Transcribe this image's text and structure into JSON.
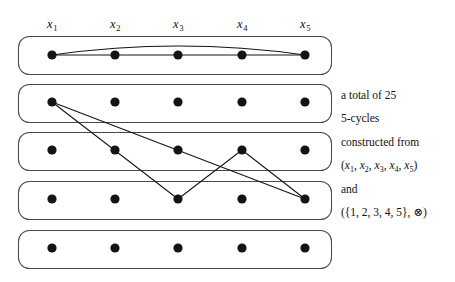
{
  "figure": {
    "columns": [
      {
        "id": "x1",
        "label": "x",
        "index": "1",
        "cx": 52
      },
      {
        "id": "x2",
        "label": "x",
        "index": "2",
        "cx": 115
      },
      {
        "id": "x3",
        "label": "x",
        "index": "3",
        "cx": 178
      },
      {
        "id": "x4",
        "label": "x",
        "index": "4",
        "cx": 242
      },
      {
        "id": "x5",
        "label": "x",
        "index": "5",
        "cx": 305
      }
    ],
    "column_header_y": 18,
    "rows": [
      {
        "id": "row-1",
        "cy": 55,
        "box_top": 36,
        "box_height": 38
      },
      {
        "id": "row-2",
        "cy": 102,
        "box_top": 84,
        "box_height": 38
      },
      {
        "id": "row-3",
        "cy": 150,
        "box_top": 132,
        "box_height": 38
      },
      {
        "id": "row-4",
        "cy": 199,
        "box_top": 181,
        "box_height": 38
      },
      {
        "id": "row-5",
        "cy": 248,
        "box_top": 230,
        "box_height": 38
      }
    ],
    "box_left": 18,
    "box_width": 313,
    "box_radius": 11,
    "vertex_radius": 4.6,
    "cycle_1": {
      "name": "top-row-5-cycle",
      "straight_edges": [
        {
          "from_row": 0,
          "from_col": 0,
          "to_row": 0,
          "to_col": 1
        },
        {
          "from_row": 0,
          "from_col": 1,
          "to_row": 0,
          "to_col": 2
        },
        {
          "from_row": 0,
          "from_col": 2,
          "to_row": 0,
          "to_col": 3
        },
        {
          "from_row": 0,
          "from_col": 3,
          "to_row": 0,
          "to_col": 4
        }
      ],
      "arc_edge": {
        "from_row": 0,
        "from_col": 0,
        "to_row": 0,
        "to_col": 4,
        "bow": 9
      }
    },
    "cycle_2": {
      "name": "cross-row-5-cycle",
      "straight_edges": [
        {
          "from_row": 1,
          "from_col": 0,
          "to_row": 3,
          "to_col": 2
        },
        {
          "from_row": 3,
          "from_col": 2,
          "to_row": 2,
          "to_col": 3
        },
        {
          "from_row": 2,
          "from_col": 3,
          "to_row": 3,
          "to_col": 4
        },
        {
          "from_row": 1,
          "from_col": 0,
          "to_row": 3,
          "to_col": 4
        }
      ]
    }
  },
  "caption": {
    "lines": [
      {
        "id": "line-total",
        "text": "a total of 25",
        "y": 90,
        "kind": "plain"
      },
      {
        "id": "line-cycles",
        "text": "5-cycles",
        "y": 113,
        "kind": "plain"
      },
      {
        "id": "line-constructed",
        "text": "constructed from",
        "y": 137,
        "kind": "plain"
      },
      {
        "id": "line-tuple",
        "text": "(x1, x2, x3, x4, x5)",
        "y": 160,
        "kind": "tuple"
      },
      {
        "id": "line-and",
        "text": "and",
        "y": 184,
        "kind": "plain"
      },
      {
        "id": "line-algebra",
        "text": "({1, 2, 3, 4, 5}, ⊗)",
        "y": 207,
        "kind": "algebra"
      }
    ],
    "tuple_vars": [
      "1",
      "2",
      "3",
      "4",
      "5"
    ],
    "algebra_set": "({1, 2, 3, 4, 5}, ",
    "algebra_op": "⊗",
    "algebra_close": ")"
  },
  "colors": {
    "background": "#ffffff",
    "box_stroke": "#4a4a4a",
    "vertex_fill": "#141414",
    "edge_stroke": "#141414",
    "text": "#111111"
  }
}
